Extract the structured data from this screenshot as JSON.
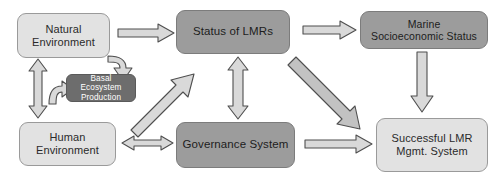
{
  "diagram": {
    "palette": {
      "light_box": "#e2e2e2",
      "mid_box": "#9c9c9c",
      "dark_box": "#6d6d6d",
      "arrow_fill": "#d4d4d4",
      "arrow_stroke": "#4a4a4a",
      "background": "#ffffff",
      "text_dark": "#2a2a2a",
      "text_light": "#ffffff"
    },
    "nodes": [
      {
        "id": "natural-environment",
        "label": "Natural\nEnvironment",
        "style": "light"
      },
      {
        "id": "status-of-lmrs",
        "label": "Status of LMRs",
        "style": "mid"
      },
      {
        "id": "marine-socioeconomic-status",
        "label": "Marine\nSocioeconomic Status",
        "style": "mid"
      },
      {
        "id": "basal-ecosystem-production",
        "label": "Basal Ecosystem\nProduction",
        "style": "dark"
      },
      {
        "id": "human-environment",
        "label": "Human\nEnvironment",
        "style": "light"
      },
      {
        "id": "governance-system",
        "label": "Governance System",
        "style": "mid"
      },
      {
        "id": "successful-lmr-mgmt-system",
        "label": "Successful LMR\nMgmt. System",
        "style": "light"
      }
    ],
    "edges": [
      {
        "id": "natural-to-status",
        "from": "natural-environment",
        "to": "status-of-lmrs",
        "kind": "block-arrow",
        "direction": "right"
      },
      {
        "id": "status-to-marine",
        "from": "status-of-lmrs",
        "to": "marine-socioeconomic-status",
        "kind": "block-arrow",
        "direction": "right"
      },
      {
        "id": "natural-to-basal",
        "from": "natural-environment",
        "to": "basal-ecosystem-production",
        "kind": "curved-arrow",
        "direction": "down"
      },
      {
        "id": "human-to-basal",
        "from": "human-environment",
        "to": "basal-ecosystem-production",
        "kind": "curved-arrow",
        "direction": "right"
      },
      {
        "id": "natural-human-bidirectional",
        "from": "natural-environment",
        "to": "human-environment",
        "kind": "block-arrow",
        "direction": "vertical-double"
      },
      {
        "id": "basal-to-status-diagonal",
        "from": "basal-ecosystem-production",
        "to": "status-of-lmrs",
        "kind": "block-arrow",
        "direction": "diagonal-up-right"
      },
      {
        "id": "status-governance-bidirectional",
        "from": "status-of-lmrs",
        "to": "governance-system",
        "kind": "block-arrow",
        "direction": "vertical-double"
      },
      {
        "id": "human-governance-bidirectional",
        "from": "human-environment",
        "to": "governance-system",
        "kind": "block-arrow",
        "direction": "horizontal-double"
      },
      {
        "id": "status-to-successful-diagonal",
        "from": "status-of-lmrs",
        "to": "successful-lmr-mgmt-system",
        "kind": "block-arrow",
        "direction": "diagonal-down-right"
      },
      {
        "id": "marine-to-successful",
        "from": "marine-socioeconomic-status",
        "to": "successful-lmr-mgmt-system",
        "kind": "block-arrow",
        "direction": "down"
      },
      {
        "id": "governance-to-successful",
        "from": "governance-system",
        "to": "successful-lmr-mgmt-system",
        "kind": "block-arrow",
        "direction": "right"
      }
    ]
  }
}
